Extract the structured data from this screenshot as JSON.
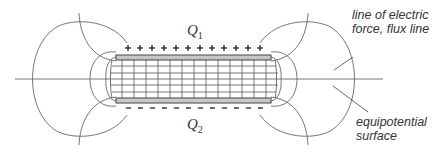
{
  "diagram": {
    "top_plate": {
      "charge_label": "Q",
      "charge_subscript": "1",
      "sign": "+",
      "sign_count": 13
    },
    "bottom_plate": {
      "charge_label": "Q",
      "charge_subscript": "2",
      "sign": "–",
      "sign_count": 13
    },
    "annotations": {
      "flux_line_1": "line of electric",
      "flux_line_2": "force, flux line",
      "equipotential_1": "equipotential",
      "equipotential_2": "surface"
    },
    "colors": {
      "line": "#555555",
      "plate_fill": "#c8c8c8",
      "plate_border": "#444444",
      "text": "#333333"
    }
  }
}
